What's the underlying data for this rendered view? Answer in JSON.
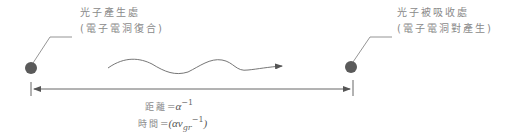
{
  "diagram": {
    "type": "photon-recycling distance diagram",
    "emission_point": {
      "line1": "光子產生處",
      "line2": "(電子電洞復合)"
    },
    "absorption_point": {
      "line1": "光子被吸收處",
      "line2": "(電子電洞對產生)"
    },
    "photon": "wavy-arrow",
    "distance_formula": {
      "label": "距離",
      "equals": "=",
      "symbol": "α",
      "exponent": "−1"
    },
    "time_formula": {
      "label": "時間",
      "equals": "=",
      "open": "(αv",
      "subscript": "gr",
      "exponent": "−1",
      "close": ")"
    },
    "colors": {
      "dot": "#5a5a5a",
      "line": "#6e6e6e",
      "text": "#8a8a8a"
    }
  }
}
